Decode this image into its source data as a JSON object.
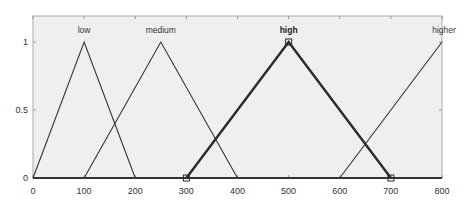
{
  "chart_data": {
    "type": "line",
    "title": "",
    "xlabel": "",
    "ylabel": "",
    "xlim": [
      0,
      800
    ],
    "ylim": [
      0,
      1
    ],
    "x_ticks": [
      0,
      100,
      200,
      300,
      400,
      500,
      600,
      700,
      800
    ],
    "y_ticks": [
      0,
      0.5,
      1
    ],
    "x_tick_labels": [
      "0",
      "100",
      "200",
      "300",
      "400",
      "500",
      "600",
      "700",
      "800"
    ],
    "y_tick_labels": [
      "0",
      "0.5",
      "1"
    ],
    "grid": false,
    "legend": "none",
    "series": [
      {
        "name": "low",
        "shape": "triangular",
        "params": [
          0,
          100,
          200
        ],
        "x": [
          0,
          100,
          200
        ],
        "y": [
          0,
          1,
          0
        ],
        "selected": false
      },
      {
        "name": "medium",
        "shape": "triangular",
        "params": [
          100,
          250,
          400
        ],
        "x": [
          100,
          250,
          400
        ],
        "y": [
          0,
          1,
          0
        ],
        "selected": false
      },
      {
        "name": "high",
        "shape": "triangular",
        "params": [
          300,
          500,
          700
        ],
        "x": [
          300,
          500,
          700
        ],
        "y": [
          0,
          1,
          0
        ],
        "selected": true,
        "markers": [
          300,
          500,
          700
        ]
      },
      {
        "name": "higher",
        "shape": "triangular",
        "params": [
          600,
          800,
          1000
        ],
        "x": [
          600,
          800
        ],
        "y": [
          0,
          1
        ],
        "selected": false
      }
    ],
    "annotations": [
      "low",
      "medium",
      "high",
      "higher"
    ]
  },
  "colors": {
    "plot_background": "#efefef",
    "axis": "#999999",
    "line": "#333333",
    "selected_line": "#2a2a2a",
    "text": "#333333"
  }
}
